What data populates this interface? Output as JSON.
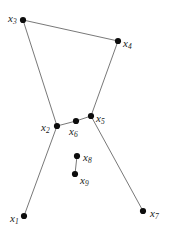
{
  "figure": {
    "kind": "node-link-diagram",
    "background_color": "#ffffff",
    "edge_color": "#555555",
    "node_color": "#0d0d0d",
    "label_color": "#1a1a1a",
    "width": 171,
    "height": 241
  },
  "nodes": [
    {
      "id": "x1",
      "base": "x",
      "sub": "1",
      "label": "x1",
      "x": 24,
      "y": 216,
      "label_x": 10,
      "label_y": 213
    },
    {
      "id": "x2",
      "base": "x",
      "sub": "2",
      "label": "x2",
      "x": 57,
      "y": 126,
      "label_x": 41,
      "label_y": 122
    },
    {
      "id": "x3",
      "base": "x",
      "sub": "3",
      "label": "x3",
      "x": 23,
      "y": 20,
      "label_x": 8,
      "label_y": 13
    },
    {
      "id": "x4",
      "base": "x",
      "sub": "4",
      "label": "x4",
      "x": 118,
      "y": 41,
      "label_x": 123,
      "label_y": 38
    },
    {
      "id": "x5",
      "base": "x",
      "sub": "5",
      "label": "x5",
      "x": 91,
      "y": 116,
      "label_x": 96,
      "label_y": 113
    },
    {
      "id": "x6",
      "base": "x",
      "sub": "6",
      "label": "x6",
      "x": 76,
      "y": 121,
      "label_x": 69,
      "label_y": 126
    },
    {
      "id": "x7",
      "base": "x",
      "sub": "7",
      "label": "x7",
      "x": 143,
      "y": 211,
      "label_x": 150,
      "label_y": 208
    },
    {
      "id": "x8",
      "base": "x",
      "sub": "8",
      "label": "x8",
      "x": 77,
      "y": 156,
      "label_x": 83,
      "label_y": 152
    },
    {
      "id": "x9",
      "base": "x",
      "sub": "9",
      "label": "x9",
      "x": 75,
      "y": 174,
      "label_x": 80,
      "label_y": 175
    }
  ],
  "edges": [
    {
      "from": "x3",
      "to": "x4",
      "x1": 23,
      "y1": 20,
      "x2": 118,
      "y2": 41
    },
    {
      "from": "x3",
      "to": "x2",
      "x1": 23,
      "y1": 20,
      "x2": 57,
      "y2": 126
    },
    {
      "from": "x4",
      "to": "x5",
      "x1": 118,
      "y1": 41,
      "x2": 91,
      "y2": 116
    },
    {
      "from": "x2",
      "to": "x6",
      "x1": 57,
      "y1": 126,
      "x2": 76,
      "y2": 121
    },
    {
      "from": "x6",
      "to": "x5",
      "x1": 76,
      "y1": 121,
      "x2": 91,
      "y2": 116
    },
    {
      "from": "x2",
      "to": "x1",
      "x1": 57,
      "y1": 126,
      "x2": 24,
      "y2": 216
    },
    {
      "from": "x5",
      "to": "x7",
      "x1": 91,
      "y1": 116,
      "x2": 143,
      "y2": 211
    },
    {
      "from": "x8",
      "to": "x9",
      "x1": 77,
      "y1": 156,
      "x2": 75,
      "y2": 174
    }
  ],
  "node_radius": 3.1,
  "edge_width": 0.8
}
